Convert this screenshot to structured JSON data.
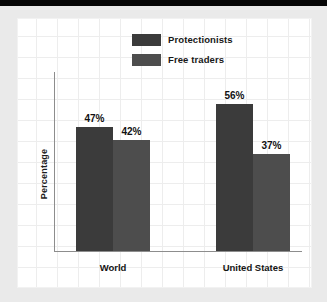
{
  "chart_data": {
    "type": "bar",
    "title": "",
    "xlabel": "",
    "ylabel": "Percentage",
    "ylim": [
      0,
      68
    ],
    "grid": true,
    "legend_position": "top-center",
    "categories": [
      "World",
      "United States"
    ],
    "series": [
      {
        "name": "Protectionists",
        "color": "#3b3b3b",
        "values": [
          47,
          56
        ],
        "labels": [
          "47%",
          "56%"
        ]
      },
      {
        "name": "Free traders",
        "color": "#4d4d4d",
        "values": [
          42,
          37
        ],
        "labels": [
          "42%",
          "37%"
        ]
      }
    ]
  },
  "legend": {
    "items": [
      {
        "label": "Protectionists",
        "swatch": "#3b3b3b"
      },
      {
        "label": "Free traders",
        "swatch": "#4d4d4d"
      }
    ]
  },
  "axes": {
    "y_title": "Percentage",
    "x_groups": [
      "World",
      "United States"
    ]
  },
  "bars": [
    {
      "value_label": "47%",
      "series": "Protectionists",
      "group": "World"
    },
    {
      "value_label": "42%",
      "series": "Free traders",
      "group": "World"
    },
    {
      "value_label": "56%",
      "series": "Protectionists",
      "group": "United States"
    },
    {
      "value_label": "37%",
      "series": "Free traders",
      "group": "United States"
    }
  ]
}
